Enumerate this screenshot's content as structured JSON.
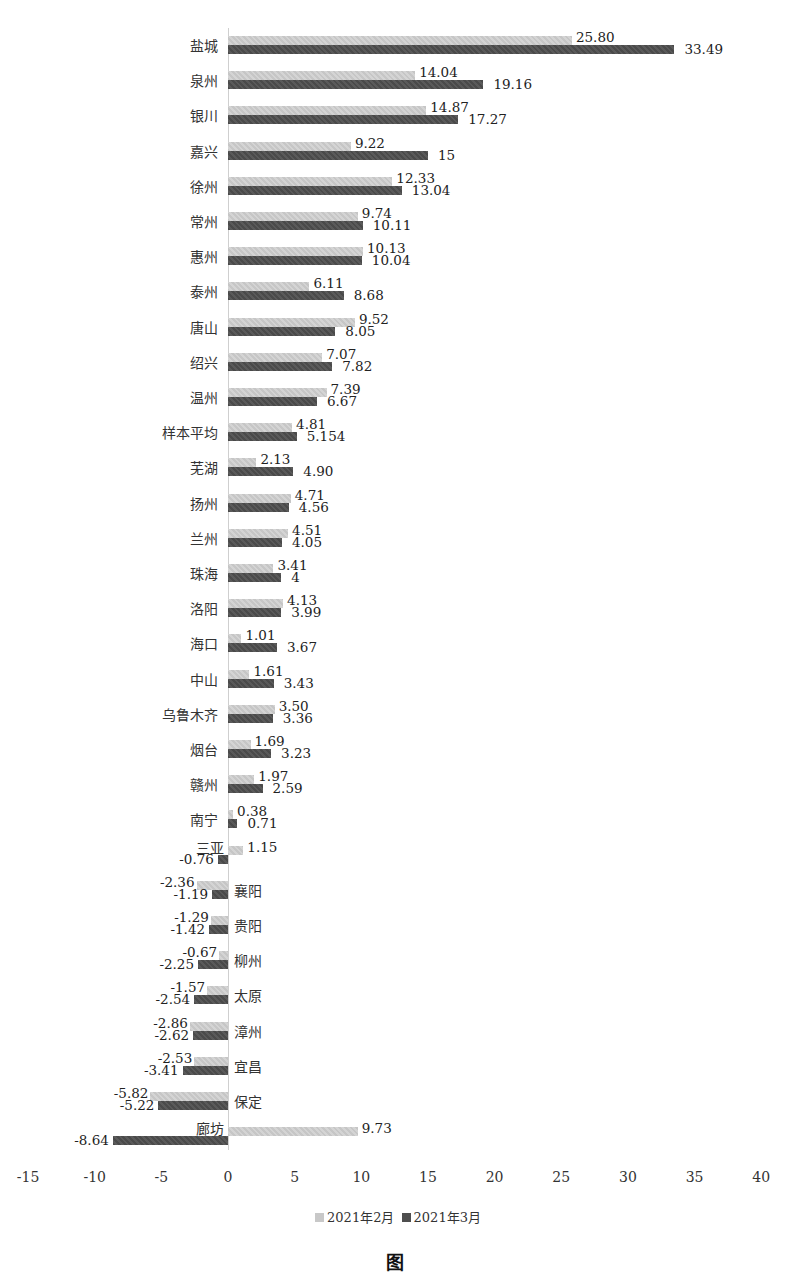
{
  "chart_data": {
    "type": "bar",
    "orientation": "horizontal",
    "title": "",
    "xlabel": "",
    "ylabel": "",
    "xlim": [
      -15,
      40
    ],
    "xticks": [
      -15,
      -10,
      -5,
      0,
      5,
      10,
      15,
      20,
      25,
      30,
      35,
      40
    ],
    "grid": false,
    "legend_position": "bottom",
    "categories": [
      "盐城",
      "泉州",
      "银川",
      "嘉兴",
      "徐州",
      "常州",
      "惠州",
      "泰州",
      "唐山",
      "绍兴",
      "温州",
      "样本平均",
      "芜湖",
      "扬州",
      "兰州",
      "珠海",
      "洛阳",
      "海口",
      "中山",
      "乌鲁木齐",
      "烟台",
      "赣州",
      "南宁",
      "三亚",
      "襄阳",
      "贵阳",
      "柳州",
      "太原",
      "漳州",
      "宜昌",
      "保定",
      "廊坊"
    ],
    "series": [
      {
        "name": "2021年2月",
        "color": "#cccccc",
        "values": [
          25.8,
          14.04,
          14.87,
          9.22,
          12.33,
          9.74,
          10.13,
          6.11,
          9.52,
          7.07,
          7.39,
          4.81,
          2.13,
          4.71,
          4.51,
          3.41,
          4.13,
          1.01,
          1.61,
          3.5,
          1.69,
          1.97,
          0.38,
          1.15,
          -2.36,
          -1.29,
          -0.67,
          -1.57,
          -2.86,
          -2.53,
          -5.82,
          9.73
        ],
        "labels": [
          "25.80",
          "14.04",
          "14.87",
          "9.22",
          "12.33",
          "9.74",
          "10.13",
          "6.11",
          "9.52",
          "7.07",
          "7.39",
          "4.81",
          "2.13",
          "4.71",
          "4.51",
          "3.41",
          "4.13",
          "1.01",
          "1.61",
          "3.50",
          "1.69",
          "1.97",
          "0.38",
          "1.15",
          "-2.36",
          "-1.29",
          "-0.67",
          "-1.57",
          "-2.86",
          "-2.53",
          "-5.82",
          "9.73"
        ]
      },
      {
        "name": "2021年3月",
        "color": "#505050",
        "values": [
          33.49,
          19.16,
          17.27,
          15,
          13.04,
          10.11,
          10.04,
          8.68,
          8.05,
          7.82,
          6.67,
          5.154,
          4.9,
          4.56,
          4.05,
          4,
          3.99,
          3.67,
          3.43,
          3.36,
          3.23,
          2.59,
          0.71,
          -0.76,
          -1.19,
          -1.42,
          -2.25,
          -2.54,
          -2.62,
          -3.41,
          -5.22,
          -8.64
        ],
        "labels": [
          "33.49",
          "19.16",
          "17.27",
          "15",
          "13.04",
          "10.11",
          "10.04",
          "8.68",
          "8.05",
          "7.82",
          "6.67",
          "5.154",
          "4.90",
          "4.56",
          "4.05",
          "4",
          "3.99",
          "3.67",
          "3.43",
          "3.36",
          "3.23",
          "2.59",
          "0.71",
          "-0.76",
          "-1.19",
          "-1.42",
          "-2.25",
          "-2.54",
          "-2.62",
          "-3.41",
          "-5.22",
          "-8.64"
        ]
      }
    ]
  },
  "legend": {
    "feb": "2021年2月",
    "mar": "2021年3月"
  },
  "caption": "图"
}
